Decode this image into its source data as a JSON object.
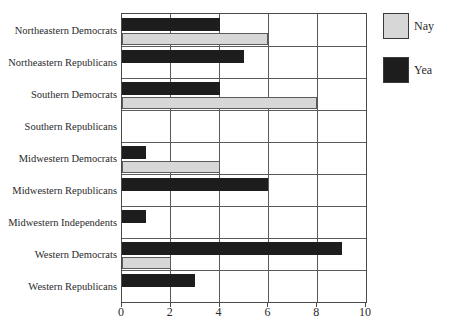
{
  "chart_data": {
    "type": "bar",
    "orientation": "horizontal",
    "title": "",
    "categories": [
      "Northeastern Democrats",
      "Northeastern Republicans",
      "Southern Democrats",
      "Southern Republicans",
      "Midwestern Democrats",
      "Midwestern Republicans",
      "Midwestern Independents",
      "Western Democrats",
      "Western Republicans"
    ],
    "series": [
      {
        "name": "Yea",
        "color": "#1d1d1d",
        "values": [
          4,
          5,
          4,
          0,
          1,
          6,
          1,
          9,
          3
        ]
      },
      {
        "name": "Nay",
        "color": "#d7d7d7",
        "values": [
          6,
          0,
          8,
          0,
          4,
          0,
          0,
          2,
          0
        ]
      }
    ],
    "xlim": [
      0,
      10
    ],
    "xticks": [
      0,
      2,
      4,
      6,
      8,
      10
    ],
    "grid": true,
    "legend": {
      "position": "top-right",
      "entries": [
        {
          "label": "Nay",
          "series": "Nay"
        },
        {
          "label": "Yea",
          "series": "Yea"
        }
      ]
    }
  }
}
